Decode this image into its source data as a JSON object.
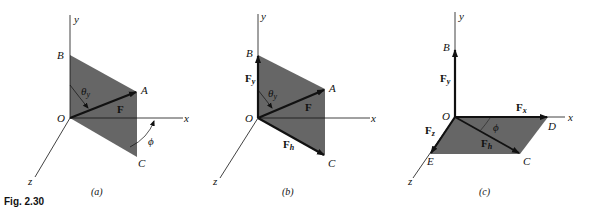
{
  "figure": {
    "caption": "Fig. 2.30",
    "colors": {
      "shade": "#555555",
      "line": "#111111",
      "background": "#ffffff"
    }
  },
  "panels": [
    {
      "id": "a",
      "label": "(a)",
      "axes": {
        "x": "x",
        "y": "y",
        "z": "z"
      },
      "points": {
        "origin": "O",
        "B": "B",
        "A": "A",
        "C": "C"
      },
      "vectors": {
        "F": "F"
      },
      "angles": {
        "theta": "θ",
        "theta_sub": "y",
        "phi": "ϕ"
      }
    },
    {
      "id": "b",
      "label": "(b)",
      "axes": {
        "x": "x",
        "y": "y",
        "z": "z"
      },
      "points": {
        "origin": "O",
        "B": "B",
        "A": "A",
        "C": "C"
      },
      "vectors": {
        "F": "F",
        "Fy": "F",
        "Fy_sub": "y",
        "Fh": "F",
        "Fh_sub": "h"
      },
      "angles": {
        "theta": "θ",
        "theta_sub": "y"
      }
    },
    {
      "id": "c",
      "label": "(c)",
      "axes": {
        "x": "x",
        "y": "y",
        "z": "z"
      },
      "points": {
        "origin": "O",
        "B": "B",
        "C": "C",
        "D": "D",
        "E": "E"
      },
      "vectors": {
        "Fy": "F",
        "Fy_sub": "y",
        "Fx": "F",
        "Fx_sub": "x",
        "Fz": "F",
        "Fz_sub": "z",
        "Fh": "F",
        "Fh_sub": "h"
      },
      "angles": {
        "phi": "ϕ"
      }
    }
  ]
}
